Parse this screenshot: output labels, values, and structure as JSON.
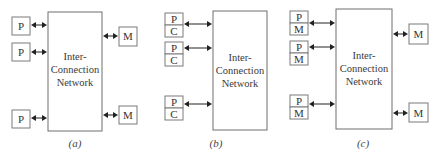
{
  "diagram": {
    "panels": [
      {
        "id": "a",
        "caption": "(a)",
        "network_label": [
          "Inter-",
          "Connection",
          "Network"
        ],
        "left_nodes": [
          {
            "top": "P"
          },
          {
            "top": "P"
          },
          {
            "top": "P"
          }
        ],
        "right_nodes": [
          {
            "top": "M"
          },
          {
            "top": "M"
          }
        ]
      },
      {
        "id": "b",
        "caption": "(b)",
        "network_label": [
          "Inter-",
          "Connection",
          "Network"
        ],
        "left_nodes": [
          {
            "top": "P",
            "bottom": "C"
          },
          {
            "top": "P",
            "bottom": "C"
          },
          {
            "top": "P",
            "bottom": "C"
          }
        ],
        "right_nodes": []
      },
      {
        "id": "c",
        "caption": "(c)",
        "network_label": [
          "Inter-",
          "Connection",
          "Network"
        ],
        "left_nodes": [
          {
            "top": "P",
            "bottom": "M"
          },
          {
            "top": "P",
            "bottom": "M"
          },
          {
            "top": "P",
            "bottom": "M"
          }
        ],
        "right_nodes": [
          {
            "top": "M"
          },
          {
            "top": "M"
          }
        ]
      }
    ]
  }
}
